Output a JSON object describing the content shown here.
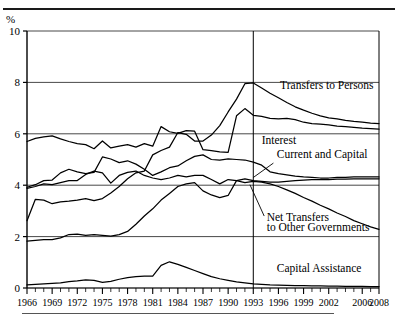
{
  "figure": {
    "unit_label": "%",
    "vertical_divider_year": 1993,
    "top_rule": true,
    "bottom_rule": true
  },
  "chart_data": {
    "type": "line",
    "title": "",
    "subtitle": "",
    "xlabel": "",
    "ylabel": "%",
    "ylim": [
      0,
      10
    ],
    "yticks": [
      0,
      2,
      4,
      6,
      8,
      10
    ],
    "xlim": [
      1966,
      2008
    ],
    "xticks": [
      1966,
      1969,
      1972,
      1975,
      1978,
      1981,
      1984,
      1987,
      1990,
      1993,
      1996,
      1999,
      2002,
      2006,
      2008
    ],
    "xtick_labels": [
      "1966",
      "1969",
      "1972",
      "1975",
      "1978",
      "1981",
      "1984",
      "1987",
      "1990",
      "1993",
      "1996",
      "1999",
      "2002",
      "2006",
      "2008"
    ],
    "minor_tick_interval": 1,
    "grid": "horizontal",
    "legend": "inline-annotations",
    "annotations": [
      {
        "text": "Transfers to Persons",
        "x": 1996.2,
        "y": 7.75,
        "leader": false
      },
      {
        "text": "Interest",
        "x": 1994.0,
        "y": 5.6,
        "leader": false
      },
      {
        "text": "Current and Capital",
        "x": 1995.8,
        "y": 5.05,
        "leader": true
      },
      {
        "text": "Net Transfers",
        "x": 1994.6,
        "y": 2.62,
        "leader": true
      },
      {
        "text": "to Other Governments",
        "x": 1994.6,
        "y": 2.22,
        "leader": false
      },
      {
        "text": "Capital Assistance",
        "x": 1995.8,
        "y": 0.62,
        "leader": false
      }
    ],
    "series": [
      {
        "name": "Transfers to Persons",
        "x": [
          1966,
          1967,
          1968,
          1969,
          1970,
          1971,
          1972,
          1973,
          1974,
          1975,
          1976,
          1977,
          1978,
          1979,
          1980,
          1981,
          1982,
          1983,
          1984,
          1985,
          1986,
          1987,
          1988,
          1989,
          1990,
          1991,
          1992,
          1993,
          1994,
          1995,
          1996,
          1997,
          1998,
          1999,
          2000,
          2001,
          2002,
          2003,
          2004,
          2005,
          2006,
          2007,
          2008
        ],
        "values": [
          5.7,
          5.82,
          5.88,
          5.92,
          5.8,
          5.7,
          5.62,
          5.58,
          5.42,
          5.72,
          5.45,
          5.52,
          5.58,
          5.48,
          5.62,
          5.52,
          6.28,
          6.08,
          6.02,
          6.12,
          6.1,
          5.38,
          5.35,
          5.3,
          5.28,
          6.7,
          6.98,
          6.72,
          6.68,
          6.6,
          6.58,
          6.6,
          6.55,
          6.45,
          6.4,
          6.38,
          6.35,
          6.3,
          6.28,
          6.25,
          6.22,
          6.2,
          6.18
        ]
      },
      {
        "name": "Interest",
        "x": [
          1966,
          1967,
          1968,
          1969,
          1970,
          1971,
          1972,
          1973,
          1974,
          1975,
          1976,
          1977,
          1978,
          1979,
          1980,
          1981,
          1982,
          1983,
          1984,
          1985,
          1986,
          1987,
          1988,
          1989,
          1990,
          1991,
          1992,
          1993,
          1994,
          1995,
          1996,
          1997,
          1998,
          1999,
          2000,
          2001,
          2002,
          2003,
          2004,
          2005,
          2006,
          2007,
          2008
        ],
        "values": [
          2.62,
          3.45,
          3.42,
          3.28,
          3.35,
          3.38,
          3.42,
          3.48,
          3.4,
          3.48,
          3.7,
          3.95,
          4.25,
          4.48,
          4.55,
          5.18,
          5.35,
          5.48,
          6.05,
          5.98,
          5.72,
          5.72,
          5.95,
          6.32,
          6.85,
          7.35,
          7.95,
          7.98,
          7.78,
          7.58,
          7.4,
          7.22,
          7.05,
          6.92,
          6.8,
          6.7,
          6.62,
          6.58,
          6.52,
          6.48,
          6.45,
          6.42,
          6.4
        ]
      },
      {
        "name": "Current and Capital",
        "x": [
          1966,
          1967,
          1968,
          1969,
          1970,
          1971,
          1972,
          1973,
          1974,
          1975,
          1976,
          1977,
          1978,
          1979,
          1980,
          1981,
          1982,
          1983,
          1984,
          1985,
          1986,
          1987,
          1988,
          1989,
          1990,
          1991,
          1992,
          1993,
          1994,
          1995,
          1996,
          1997,
          1998,
          1999,
          2000,
          2001,
          2002,
          2003,
          2004,
          2005,
          2006,
          2007,
          2008
        ],
        "values": [
          3.92,
          4.02,
          4.18,
          4.2,
          4.48,
          4.62,
          4.52,
          4.45,
          4.5,
          5.1,
          5.02,
          4.88,
          4.95,
          4.82,
          4.62,
          4.38,
          4.52,
          4.68,
          4.75,
          4.95,
          5.12,
          5.18,
          5.0,
          4.98,
          5.02,
          5.0,
          4.98,
          4.9,
          4.78,
          4.52,
          4.45,
          4.4,
          4.35,
          4.32,
          4.3,
          4.28,
          4.28,
          4.3,
          4.3,
          4.32,
          4.32,
          4.32,
          4.32
        ]
      },
      {
        "name": "Net Transfers to Other Governments",
        "x": [
          1966,
          1967,
          1968,
          1969,
          1970,
          1971,
          1972,
          1973,
          1974,
          1975,
          1976,
          1977,
          1978,
          1979,
          1980,
          1981,
          1982,
          1983,
          1984,
          1985,
          1986,
          1987,
          1988,
          1989,
          1990,
          1991,
          1992,
          1993,
          1994,
          1995,
          1996,
          1997,
          1998,
          1999,
          2000,
          2001,
          2002,
          2003,
          2004,
          2005,
          2006,
          2007,
          2008
        ],
        "values": [
          3.88,
          3.95,
          4.05,
          4.02,
          4.1,
          4.18,
          4.18,
          4.42,
          4.55,
          4.48,
          4.08,
          4.38,
          4.5,
          4.55,
          4.38,
          4.28,
          4.22,
          4.28,
          4.38,
          4.32,
          4.38,
          4.38,
          4.22,
          4.05,
          4.22,
          4.18,
          4.1,
          4.15,
          4.12,
          4.05,
          3.95,
          3.82,
          3.68,
          3.52,
          3.38,
          3.22,
          3.08,
          2.92,
          2.78,
          2.62,
          2.5,
          2.38,
          2.28
        ]
      },
      {
        "name": "Low series",
        "x": [
          1966,
          1967,
          1968,
          1969,
          1970,
          1971,
          1972,
          1973,
          1974,
          1975,
          1976,
          1977,
          1978,
          1979,
          1980,
          1981,
          1982,
          1983,
          1984,
          1985,
          1986,
          1987,
          1988,
          1989,
          1990,
          1991,
          1992,
          1993,
          1994,
          1995,
          1996,
          1997,
          1998,
          1999,
          2000,
          2001,
          2002,
          2003,
          2004,
          2005,
          2006,
          2007,
          2008
        ],
        "values": [
          1.82,
          1.85,
          1.88,
          1.88,
          1.95,
          2.08,
          2.1,
          2.05,
          2.08,
          2.05,
          2.02,
          2.08,
          2.2,
          2.48,
          2.8,
          3.08,
          3.42,
          3.68,
          3.95,
          4.05,
          4.1,
          3.78,
          3.62,
          3.52,
          3.6,
          4.18,
          4.25,
          4.18,
          4.15,
          4.12,
          4.12,
          4.15,
          4.18,
          4.2,
          4.22,
          4.22,
          4.22,
          4.24,
          4.24,
          4.25,
          4.25,
          4.25,
          4.25
        ]
      },
      {
        "name": "Capital Assistance",
        "x": [
          1966,
          1967,
          1968,
          1969,
          1970,
          1971,
          1972,
          1973,
          1974,
          1975,
          1976,
          1977,
          1978,
          1979,
          1980,
          1981,
          1982,
          1983,
          1984,
          1985,
          1986,
          1987,
          1988,
          1989,
          1990,
          1991,
          1992,
          1993,
          1994,
          1995,
          1996,
          1997,
          1998,
          1999,
          2000,
          2001,
          2002,
          2003,
          2004,
          2005,
          2006,
          2007,
          2008
        ],
        "values": [
          0.12,
          0.14,
          0.16,
          0.18,
          0.2,
          0.25,
          0.28,
          0.32,
          0.3,
          0.22,
          0.26,
          0.34,
          0.4,
          0.44,
          0.46,
          0.46,
          0.88,
          1.02,
          0.92,
          0.8,
          0.68,
          0.56,
          0.44,
          0.36,
          0.3,
          0.24,
          0.2,
          0.16,
          0.14,
          0.12,
          0.11,
          0.1,
          0.09,
          0.09,
          0.08,
          0.08,
          0.07,
          0.07,
          0.06,
          0.06,
          0.06,
          0.05,
          0.05
        ]
      }
    ]
  },
  "colors": {
    "line": "#000000",
    "grid": "#333333",
    "axis": "#000000",
    "background": "#ffffff"
  }
}
